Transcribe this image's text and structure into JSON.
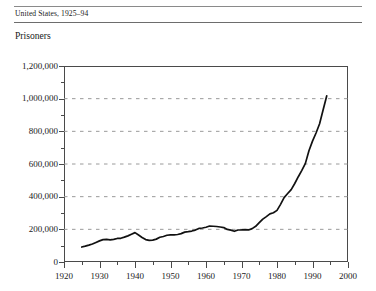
{
  "header": {
    "caption": "United States, 1925–94"
  },
  "chart_data": {
    "type": "line",
    "title": "United States, 1925–94",
    "ylabel": "Prisoners",
    "xlabel": "",
    "xlim": [
      1920,
      2000
    ],
    "ylim": [
      0,
      1200000
    ],
    "grid": true,
    "legend_position": "none",
    "y_ticks": [
      0,
      200000,
      400000,
      600000,
      800000,
      1000000,
      1200000
    ],
    "y_tick_labels": [
      "0",
      "200,000",
      "400,000",
      "600,000",
      "800,000",
      "1,000,000",
      "1,200,000"
    ],
    "y_minor_ticks": [
      100000,
      300000,
      500000,
      700000,
      900000,
      1100000
    ],
    "x_ticks": [
      1920,
      1930,
      1940,
      1950,
      1960,
      1970,
      1980,
      1990,
      2000
    ],
    "x_tick_labels": [
      "1920",
      "1930",
      "1940",
      "1950",
      "1960",
      "1970",
      "1980",
      "1990",
      "2000"
    ],
    "x_minor_ticks": [
      1925,
      1935,
      1945,
      1955,
      1965,
      1975,
      1985,
      1995
    ],
    "line_color": "#111111",
    "grid_color": "#9a9a9a",
    "series": [
      {
        "name": "Prisoners",
        "x": [
          1925,
          1926,
          1927,
          1928,
          1929,
          1930,
          1931,
          1932,
          1933,
          1934,
          1935,
          1936,
          1937,
          1938,
          1939,
          1940,
          1941,
          1942,
          1943,
          1944,
          1945,
          1946,
          1947,
          1948,
          1949,
          1950,
          1951,
          1952,
          1953,
          1954,
          1955,
          1956,
          1957,
          1958,
          1959,
          1960,
          1961,
          1962,
          1963,
          1964,
          1965,
          1966,
          1967,
          1968,
          1969,
          1970,
          1971,
          1972,
          1973,
          1974,
          1975,
          1976,
          1977,
          1978,
          1979,
          1980,
          1981,
          1982,
          1983,
          1984,
          1985,
          1986,
          1987,
          1988,
          1989,
          1990,
          1991,
          1992,
          1993,
          1994
        ],
        "y": [
          91669,
          97000,
          103000,
          110000,
          120000,
          129453,
          137000,
          137997,
          136000,
          138316,
          144180,
          145038,
          152000,
          160000,
          170000,
          179818,
          165439,
          150384,
          137220,
          132456,
          133649,
          140079,
          151304,
          155977,
          163749,
          166123,
          165680,
          168233,
          173579,
          182901,
          185780,
          189565,
          195414,
          205643,
          208105,
          212953,
          220149,
          218830,
          217283,
          214336,
          210895,
          199654,
          194896,
          187914,
          196007,
          196429,
          198061,
          196183,
          204211,
          218466,
          240593,
          262833,
          278141,
          294396,
          301470,
          315974,
          353167,
          394374,
          419346,
          443398,
          480568,
          522084,
          560812,
          603732,
          680907,
          739980,
          789610,
          846277,
          932074,
          1016691
        ],
        "y_start_value": 91669,
        "y_end_value": 1016691,
        "peak_1940": 179818,
        "trough_1945": 133649,
        "plateau_1960s_1970s": 200000
      }
    ]
  }
}
